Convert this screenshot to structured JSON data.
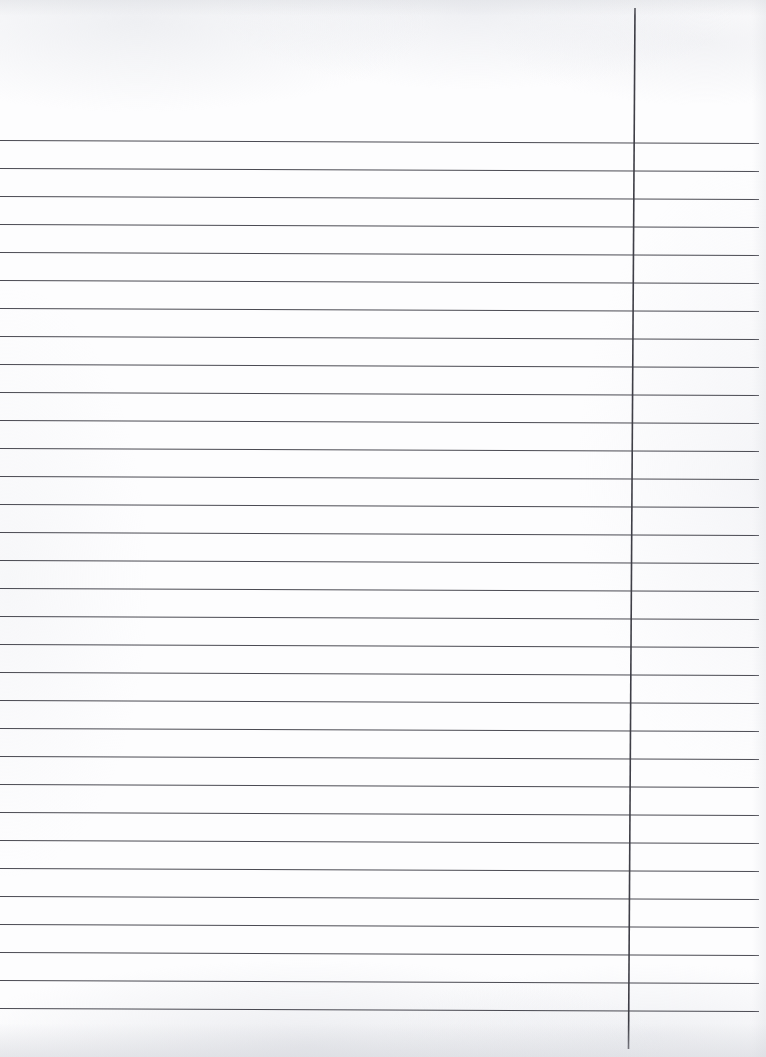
{
  "document": {
    "kind": "scanned-ruled-notebook-page",
    "title": "Blank ruled paper",
    "page_width": 766,
    "page_height": 1057,
    "has_text_content": false,
    "visible_text": ""
  },
  "paper": {
    "background_color": "#fdfdfe",
    "texture_color": "#e6e8ec",
    "bottom_edge_shadow_color": "#d0d2d8"
  },
  "ruling": {
    "line_color": "#4a4a52",
    "line_width": 1.15,
    "margin_rule_color": "#3f3f47",
    "margin_rule_width": 1.6,
    "horizontal_line_count": 32,
    "first_line_y": 140.5,
    "line_spacing": 28.0,
    "left_x": 0,
    "right_x": 759,
    "slant_drop_px": 3.0,
    "margin_rule": {
      "top_x": 635.0,
      "top_y": 8.0,
      "bottom_x": 628.5,
      "bottom_y": 1049.0
    }
  }
}
